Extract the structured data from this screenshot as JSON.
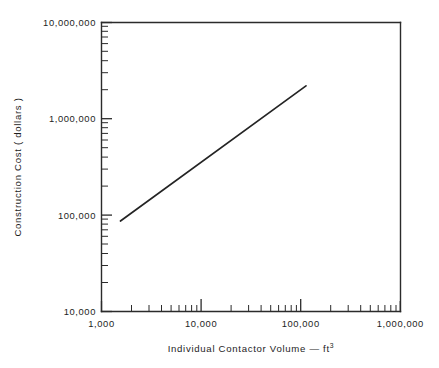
{
  "chart_data": {
    "type": "line",
    "title": "",
    "xlabel": "Individual  Contactor  Volume — ft",
    "xlabel_superscript": "3",
    "ylabel": "Construction  Cost ( dollars )",
    "xscale": "log",
    "yscale": "log",
    "xlim": [
      1000,
      1000000
    ],
    "ylim": [
      10000,
      10000000
    ],
    "grid": false,
    "legend": null,
    "xticks": [
      1000,
      10000,
      100000,
      1000000
    ],
    "xtick_labels": [
      "1,000",
      "10,000",
      "100,000",
      "1,000,000"
    ],
    "yticks": [
      10000,
      100000,
      1000000,
      10000000
    ],
    "ytick_labels": [
      "10,000",
      "100,000",
      "1,000,000",
      "10,000,000"
    ],
    "series": [
      {
        "name": "construction cost",
        "x": [
          1550,
          113000
        ],
        "y": [
          87000,
          2200000
        ],
        "slope_loglog": 0.77,
        "points": [
          {
            "x": 1550,
            "y": 87000
          },
          {
            "x": 10000,
            "y": 350000
          },
          {
            "x": 100000,
            "y": 2000000
          },
          {
            "x": 113000,
            "y": 2200000
          }
        ]
      }
    ],
    "annotations": []
  },
  "axes": {
    "x_tick_label_0": "1,000",
    "x_tick_label_1": "10,000",
    "x_tick_label_2": "100,000",
    "x_tick_label_3": "1,000,000",
    "y_tick_label_0": "10,000",
    "y_tick_label_1": "100,000",
    "y_tick_label_2": "1,000,000",
    "y_tick_label_3": "10,000,000",
    "x_axis_title": "Individual  Contactor  Volume — ft",
    "x_axis_title_sup": "3",
    "y_axis_title": "Construction  Cost ( dollars )"
  },
  "colors": {
    "background": "#ffffff",
    "axis": "#2b2b2b",
    "data_line": "#242424",
    "text": "#1d1d1d"
  }
}
